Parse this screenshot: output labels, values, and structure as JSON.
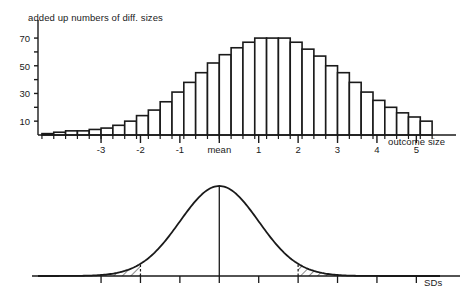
{
  "figure": {
    "width": 461,
    "height": 304,
    "background": "#ffffff",
    "ink_color": "#1a1a1a"
  },
  "panels": {
    "histogram": {
      "title": "added up numbers of diff. sizes",
      "x_axis_label": "outcome size",
      "mean_label": "mean"
    },
    "density": {
      "title": "probability distribution",
      "x_axis_label": "SDs",
      "mean_label": "mean"
    }
  },
  "chart_data": [
    {
      "type": "bar",
      "title": "added up numbers of diff. sizes",
      "xlabel": "outcome size",
      "ylabel": "",
      "xlim": [
        -4.6,
        5.6
      ],
      "ylim": [
        0,
        78
      ],
      "grid": false,
      "legend": null,
      "ytick_values": [
        10,
        20,
        30,
        40,
        50,
        60,
        70
      ],
      "ytick_labels": [
        "10",
        "",
        "30",
        "",
        "50",
        "",
        "70"
      ],
      "xtick_values": [
        -3,
        -2,
        -1,
        0,
        1,
        2,
        3,
        4,
        5
      ],
      "xtick_labels": [
        "-3",
        "-2",
        "-1",
        "mean",
        "1",
        "2",
        "3",
        "4",
        "5"
      ],
      "xtick_minor_step": 0.3,
      "bar_width_sd": 0.3,
      "categories": [
        -4.35,
        -4.05,
        -3.75,
        -3.45,
        -3.15,
        -2.85,
        -2.55,
        -2.25,
        -1.95,
        -1.65,
        -1.35,
        -1.05,
        -0.75,
        -0.45,
        -0.15,
        0.15,
        0.45,
        0.75,
        1.05,
        1.35,
        1.65,
        1.95,
        2.25,
        2.55,
        2.85,
        3.15,
        3.45,
        3.75,
        4.05,
        4.35,
        4.65,
        4.95,
        5.25
      ],
      "values": [
        1,
        2,
        3,
        3,
        4,
        5,
        7,
        10,
        14,
        18,
        24,
        31,
        38,
        45,
        52,
        58,
        63,
        67,
        70,
        70,
        70,
        67,
        62,
        57,
        50,
        45,
        38,
        31,
        25,
        20,
        16,
        13,
        10
      ]
    },
    {
      "type": "area",
      "title": "probability distribution",
      "xlabel": "SDs",
      "ylabel": "",
      "xlim": [
        -4.6,
        5.6
      ],
      "ylim": [
        0,
        1.08
      ],
      "grid": false,
      "legend": null,
      "curve": "normal bell curve, peak at mean",
      "mean_line_sd": 0,
      "xtick_values": [
        -3,
        -2,
        -1,
        0,
        1,
        2,
        3,
        4,
        5
      ],
      "xtick_labels": [
        "-3",
        "-2",
        "-1",
        "mean",
        "1",
        "2",
        "3",
        "4",
        "5"
      ],
      "shaded_tails": [
        {
          "name": "left-tail",
          "from_sd": -4.6,
          "to_sd": -2.0,
          "style": "hatched",
          "boundary_line": "dashed"
        },
        {
          "name": "right-tail",
          "from_sd": 2.0,
          "to_sd": 5.6,
          "style": "hatched",
          "boundary_line": "dashed"
        }
      ]
    }
  ]
}
